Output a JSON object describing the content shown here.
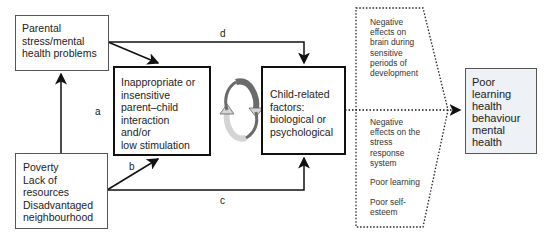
{
  "nodes": {
    "parental": {
      "lines": [
        "Parental",
        "stress/mental",
        "health problems"
      ]
    },
    "poverty": {
      "lines": [
        "Poverty",
        "Lack of",
        "resources",
        "Disadvantaged",
        "neighbourhood"
      ]
    },
    "interaction": {
      "lines": [
        "Inappropriate or",
        "insensitive",
        "parent–child",
        "interaction",
        "and/or",
        "low stimulation"
      ]
    },
    "child": {
      "lines": [
        "Child-related",
        "factors:",
        "biological or",
        "psychological"
      ]
    },
    "effects_top": {
      "lines": [
        "Negative",
        "effects on",
        "brain during",
        "sensitive",
        "periods of",
        "development"
      ]
    },
    "effects_bottom": {
      "lines": [
        "Negative",
        "effects on the",
        "stress",
        "response",
        "system"
      ]
    },
    "poor_learning": {
      "lines": [
        "Poor learning"
      ]
    },
    "poor_esteem": {
      "lines": [
        "Poor self-",
        "esteem"
      ]
    },
    "outcome": {
      "lines": [
        "Poor",
        "learning",
        "health",
        "behaviour",
        "mental",
        "health"
      ]
    }
  },
  "edge_labels": {
    "a": "a",
    "b": "b",
    "c": "c",
    "d": "d"
  },
  "colors": {
    "outcome_bg": "#eef1f5",
    "cycle_dark": "#6b6b6b",
    "cycle_light": "#d4d4d4"
  }
}
